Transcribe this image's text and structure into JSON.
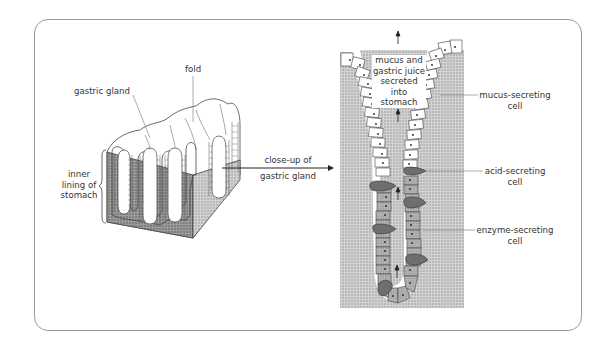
{
  "diagram": {
    "left_panel": {
      "labels": {
        "fold": "fold",
        "gastric_gland": "gastric gland",
        "inner_lining_line1": "inner",
        "inner_lining_line2": "lining of",
        "inner_lining_line3": "stomach"
      }
    },
    "connector": {
      "line1": "close-up of",
      "line2": "gastric gland"
    },
    "right_panel": {
      "secretion_label": {
        "line1": "mucus and",
        "line2": "gastric juice",
        "line3": "secreted",
        "line4": "into",
        "line5": "stomach"
      },
      "labels": {
        "mucus_cell_line1": "mucus-secreting",
        "mucus_cell_line2": "cell",
        "acid_cell_line1": "acid-secreting",
        "acid_cell_line2": "cell",
        "enzyme_cell_line1": "enzyme-secreting",
        "enzyme_cell_line2": "cell"
      }
    },
    "colors": {
      "frame": "#9a9a9a",
      "tissue_dark": "#8f8f8f",
      "tissue_light": "#c4c4c4",
      "enzyme_cell": "#a8a8a8",
      "acid_cell": "#6e6e6e",
      "mucus_cell": "#ffffff",
      "text": "#333333"
    }
  }
}
